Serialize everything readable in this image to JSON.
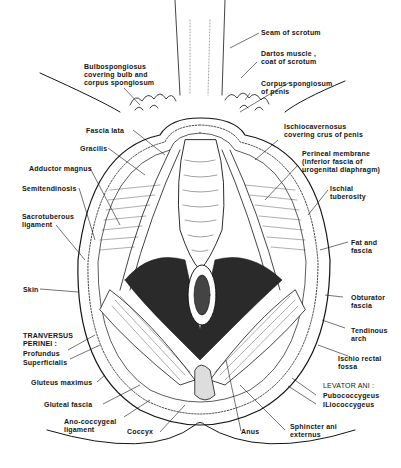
{
  "figure": {
    "labels": {
      "seam_of_scrotum": "Seam of scrotum",
      "dartos": "Dartos muscle ,\ncoat of scrotum",
      "corpus_spongiosum": "Corpus spongiosum\nof penis",
      "bulbospongiosus": "Bulbospongiosus\ncovering bulb and\ncorpus spongiosum",
      "fascia_lata": "Fascia lata",
      "gracilis": "Gracilis",
      "adductor_magnus": "Adductor magnus",
      "semitendinosis": "Semitendinosis",
      "sacrotuberous": "Sacrotuberous\nligament",
      "skin": "Skin",
      "tranversus_header": "TRANVERSUS\nPERINEI :",
      "profundus": "Profundus",
      "superficialis": "Superficialis",
      "gluteus_maximus": "Gluteus maximus",
      "gluteal_fascia": "Gluteal fascia",
      "ano_coccygeal": "Ano-coccygeal\nligament",
      "coccyx": "Coccyx",
      "anus": "Anus",
      "sphincter": "Sphincter ani\nexternus",
      "ischiocavernosus": "Ischiocavernosus\ncovering crus of penis",
      "perineal_membrane": "Perineal membrane\n(inferior fascia of\nurogenital diaphragm)",
      "ischial_tuberosity": "Ischial\ntuberosity",
      "fat_fascia": "Fat and\nfascia",
      "obturator_fascia": "Obturator\nfascia",
      "tendinous_arch": "Tendinous\narch",
      "ischio_rectal": "Ischio rectal\nfossa",
      "levator_header": "LEVATOR ANI :",
      "pubococcygeus": "Pubococcygeus",
      "iliococcygeus": "ILiococcygeus"
    },
    "colors": {
      "ink": "#151515",
      "background": "#ffffff"
    }
  }
}
